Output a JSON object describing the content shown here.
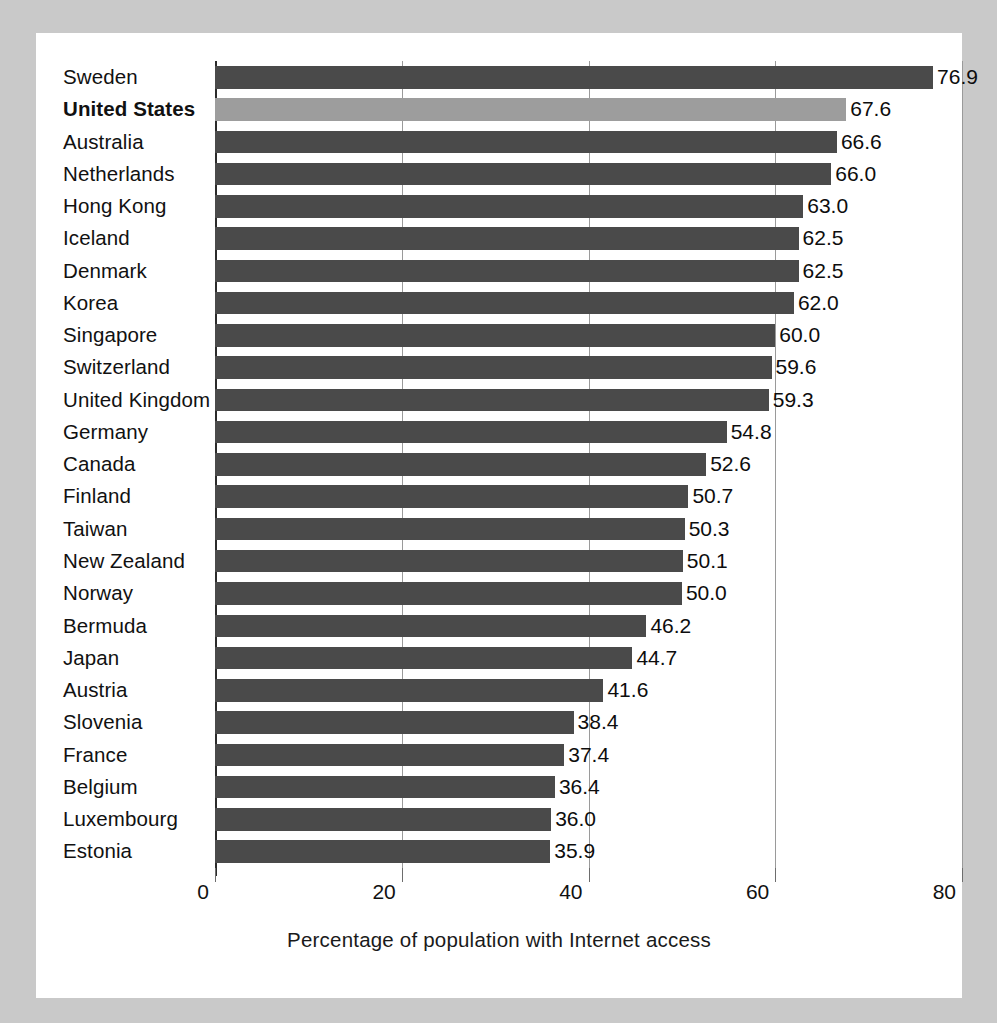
{
  "chart_data": {
    "type": "bar",
    "orientation": "horizontal",
    "title": "",
    "xlabel": "Percentage of population with Internet access",
    "ylabel": "",
    "xlim": [
      0,
      80
    ],
    "xticks": [
      0,
      20,
      40,
      60,
      80
    ],
    "xtick_labels": [
      "0",
      "20",
      "40",
      "60",
      "80"
    ],
    "grid": true,
    "legend": "none",
    "highlight_category": "United States",
    "colors": {
      "bar": "#4a4a4a",
      "highlight_bar": "#9d9d9d",
      "page_background": "#c9c9c9",
      "card_background": "#ffffff",
      "gridline": "#9a9a9a",
      "axis": "#2b2b2b",
      "text": "#111111"
    },
    "categories": [
      "Sweden",
      "United States",
      "Australia",
      "Netherlands",
      "Hong Kong",
      "Iceland",
      "Denmark",
      "Korea",
      "Singapore",
      "Switzerland",
      "United Kingdom",
      "Germany",
      "Canada",
      "Finland",
      "Taiwan",
      "New Zealand",
      "Norway",
      "Bermuda",
      "Japan",
      "Austria",
      "Slovenia",
      "France",
      "Belgium",
      "Luxembourg",
      "Estonia"
    ],
    "values": [
      76.9,
      67.6,
      66.6,
      66.0,
      63.0,
      62.5,
      62.5,
      62.0,
      60.0,
      59.6,
      59.3,
      54.8,
      52.6,
      50.7,
      50.3,
      50.1,
      50.0,
      46.2,
      44.7,
      41.6,
      38.4,
      37.4,
      36.4,
      36.0,
      35.9
    ],
    "value_labels": [
      "76.9",
      "67.6",
      "66.6",
      "66.0",
      "63.0",
      "62.5",
      "62.5",
      "62.0",
      "60.0",
      "59.6",
      "59.3",
      "54.8",
      "52.6",
      "50.7",
      "50.3",
      "50.1",
      "50.0",
      "46.2",
      "44.7",
      "41.6",
      "38.4",
      "37.4",
      "36.4",
      "36.0",
      "35.9"
    ],
    "rows": [
      {
        "label": "Sweden",
        "value": 76.9,
        "value_label": "76.9",
        "highlight": false
      },
      {
        "label": "United States",
        "value": 67.6,
        "value_label": "67.6",
        "highlight": true
      },
      {
        "label": "Australia",
        "value": 66.6,
        "value_label": "66.6",
        "highlight": false
      },
      {
        "label": "Netherlands",
        "value": 66.0,
        "value_label": "66.0",
        "highlight": false
      },
      {
        "label": "Hong Kong",
        "value": 63.0,
        "value_label": "63.0",
        "highlight": false
      },
      {
        "label": "Iceland",
        "value": 62.5,
        "value_label": "62.5",
        "highlight": false
      },
      {
        "label": "Denmark",
        "value": 62.5,
        "value_label": "62.5",
        "highlight": false
      },
      {
        "label": "Korea",
        "value": 62.0,
        "value_label": "62.0",
        "highlight": false
      },
      {
        "label": "Singapore",
        "value": 60.0,
        "value_label": "60.0",
        "highlight": false
      },
      {
        "label": "Switzerland",
        "value": 59.6,
        "value_label": "59.6",
        "highlight": false
      },
      {
        "label": "United Kingdom",
        "value": 59.3,
        "value_label": "59.3",
        "highlight": false
      },
      {
        "label": "Germany",
        "value": 54.8,
        "value_label": "54.8",
        "highlight": false
      },
      {
        "label": "Canada",
        "value": 52.6,
        "value_label": "52.6",
        "highlight": false
      },
      {
        "label": "Finland",
        "value": 50.7,
        "value_label": "50.7",
        "highlight": false
      },
      {
        "label": "Taiwan",
        "value": 50.3,
        "value_label": "50.3",
        "highlight": false
      },
      {
        "label": "New Zealand",
        "value": 50.1,
        "value_label": "50.1",
        "highlight": false
      },
      {
        "label": "Norway",
        "value": 50.0,
        "value_label": "50.0",
        "highlight": false
      },
      {
        "label": "Bermuda",
        "value": 46.2,
        "value_label": "46.2",
        "highlight": false
      },
      {
        "label": "Japan",
        "value": 44.7,
        "value_label": "44.7",
        "highlight": false
      },
      {
        "label": "Austria",
        "value": 41.6,
        "value_label": "41.6",
        "highlight": false
      },
      {
        "label": "Slovenia",
        "value": 38.4,
        "value_label": "38.4",
        "highlight": false
      },
      {
        "label": "France",
        "value": 37.4,
        "value_label": "37.4",
        "highlight": false
      },
      {
        "label": "Belgium",
        "value": 36.4,
        "value_label": "36.4",
        "highlight": false
      },
      {
        "label": "Luxembourg",
        "value": 36.0,
        "value_label": "36.0",
        "highlight": false
      },
      {
        "label": "Estonia",
        "value": 35.9,
        "value_label": "35.9",
        "highlight": false
      }
    ]
  }
}
